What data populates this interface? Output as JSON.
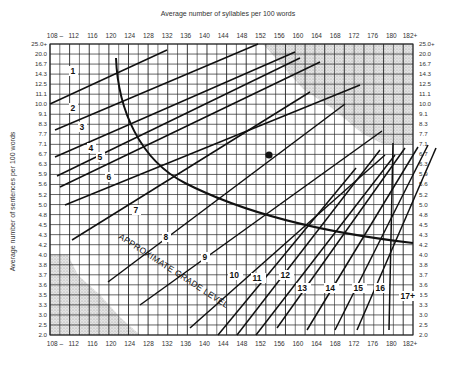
{
  "chart_data": {
    "type": "line",
    "title": "Average number of syllables per 100 words",
    "xlabel": "Average number of syllables per 100 words",
    "ylabel": "Average number of sentences per 100 words",
    "x_ticks": [
      "108 –",
      "112",
      "116",
      "120",
      "124",
      "128",
      "132",
      "136",
      "140",
      "144",
      "148",
      "152",
      "156",
      "160",
      "164",
      "168",
      "172",
      "176",
      "180",
      "182+"
    ],
    "y_ticks_left": [
      "25.0+",
      "20.0",
      "16.7",
      "14.3",
      "12.5",
      "11.1",
      "10.0",
      "9.1",
      "8.3",
      "7.7",
      "7.1",
      "6.7",
      "6.3",
      "5.9",
      "5.6",
      "5.2",
      "5.0",
      "4.8",
      "4.5",
      "4.3",
      "4.2",
      "4.0",
      "3.8",
      "3.7",
      "3.6",
      "3.5",
      "3.3",
      "3.0",
      "2.5",
      "2.0"
    ],
    "y_ticks_right": [
      "25.0+",
      "20.0",
      "16.7",
      "14.3",
      "12.5",
      "11.1",
      "10.0",
      "9.1",
      "8.3",
      "7.7",
      "7.1",
      "6.7",
      "6.3",
      "5.9",
      "5.6",
      "5.2",
      "5.0",
      "4.8",
      "4.5",
      "4.3",
      "4.2",
      "4.0",
      "3.8",
      "3.7",
      "3.6",
      "3.5",
      "3.3",
      "3.0",
      "2.5",
      "2.0"
    ],
    "grade_levels": [
      "1",
      "2",
      "3",
      "4",
      "5",
      "6",
      "7",
      "8",
      "9",
      "10",
      "11",
      "12",
      "13",
      "14",
      "15",
      "16",
      "17+"
    ],
    "annotation": "APPROXIMATE GRADE LEVEL",
    "grid": true,
    "shaded_regions": [
      "upper-right invalid zone",
      "lower-left invalid zone"
    ],
    "plotted_point": {
      "syllables": 154,
      "sentences": 6.6
    },
    "xlim": [
      108,
      182
    ],
    "ylim": [
      2.0,
      25.0
    ]
  },
  "labels": {
    "title": "Average number of syllables per 100 words",
    "ylabel": "Average number of sentences per 100 words",
    "annotation": "APPROXIMATE GRADE LEVEL"
  }
}
